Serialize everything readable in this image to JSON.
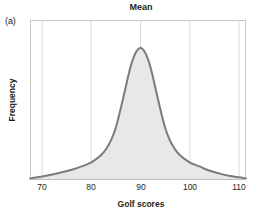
{
  "figure": {
    "panel_letter": "(a)",
    "title": "Mean",
    "background_color": "#ffffff"
  },
  "axes": {
    "xlabel": "Golf scores",
    "ylabel": "Frequency",
    "xticks": [
      "70",
      "80",
      "90",
      "100",
      "110"
    ],
    "yticks": []
  },
  "colors": {
    "curve_stroke": "#7b7b7b",
    "curve_fill": "#e8e8e8",
    "gridline": "#d9d9d9",
    "frame": "#c9c9c9",
    "text": "#231f20"
  },
  "chart_data": {
    "type": "area",
    "title": "Mean",
    "xlabel": "Golf scores",
    "ylabel": "Frequency",
    "xlim": [
      67.5,
      111.5
    ],
    "ylim": [
      0,
      1
    ],
    "xticks": [
      70,
      80,
      90,
      100,
      110
    ],
    "yticks": [],
    "grid": "vertical-only",
    "legend": "none",
    "annotations": [
      {
        "text": "Mean",
        "x": 90,
        "position": "above-plot-centered"
      },
      {
        "text": "(a)",
        "position": "top-left-outside"
      }
    ],
    "series": [
      {
        "name": "Golf score distribution",
        "kind": "smooth-density-curve",
        "fill": "#e8e8e8",
        "stroke": "#7b7b7b",
        "description": "Symmetric, sharply peaked, heavy-tailed unimodal distribution centered at the mean of 90.",
        "x": [
          67.5,
          69,
          70,
          72,
          74,
          76,
          78,
          80,
          82,
          83,
          84,
          85,
          86,
          87,
          88,
          89,
          90,
          91,
          92,
          93,
          94,
          95,
          96,
          97,
          98,
          100,
          102,
          104,
          106,
          108,
          110,
          111.5
        ],
        "y": [
          0.012,
          0.02,
          0.027,
          0.042,
          0.058,
          0.078,
          0.103,
          0.134,
          0.19,
          0.235,
          0.3,
          0.4,
          0.545,
          0.705,
          0.86,
          0.962,
          1.0,
          0.962,
          0.86,
          0.705,
          0.545,
          0.4,
          0.3,
          0.235,
          0.19,
          0.134,
          0.103,
          0.072,
          0.05,
          0.032,
          0.02,
          0.012
        ]
      }
    ]
  }
}
